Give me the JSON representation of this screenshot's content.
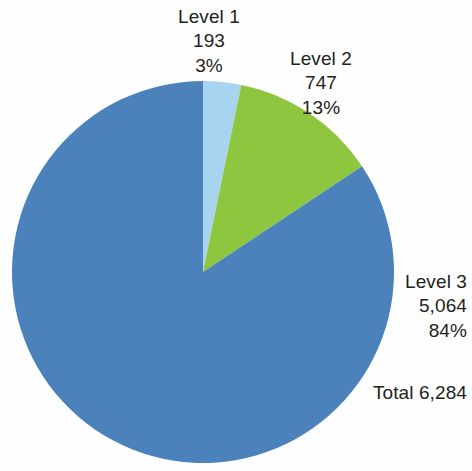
{
  "chart_data": {
    "type": "pie",
    "title": "",
    "subtitle": "",
    "xlabel": "",
    "ylabel": "",
    "legend_position": "none",
    "grid": false,
    "categories": [
      "Level 1",
      "Level 2",
      "Level 3"
    ],
    "values": [
      193,
      747,
      5064
    ],
    "percentages": [
      "3%",
      "13%",
      "84%"
    ],
    "value_labels": [
      "193",
      "747",
      "5,064"
    ],
    "colors": [
      "#a8d4f0",
      "#8ec63f",
      "#4c82bc"
    ],
    "total_label": "Total 6,284",
    "total_value": 6284,
    "start_angle_deg": 0,
    "direction": "clockwise",
    "slices": [
      {
        "name": "Level 1",
        "label": "Level 1",
        "value": "193",
        "percent": "3%",
        "color": "#a8d4f0",
        "fraction": 0.0307
      },
      {
        "name": "Level 2",
        "label": "Level 2",
        "value": "747",
        "percent": "13%",
        "color": "#8ec63f",
        "fraction": 0.1189
      },
      {
        "name": "Level 3",
        "label": "Level 3",
        "value": "5,064",
        "percent": "84%",
        "color": "#4c82bc",
        "fraction": 0.8059
      }
    ]
  },
  "callouts": {
    "level_1": {
      "label": "Level 1",
      "value": "193",
      "percent": "3%"
    },
    "level_2": {
      "label": "Level 2",
      "value": "747",
      "percent": "13%"
    },
    "level_3": {
      "label": "Level 3",
      "value": "5,064",
      "percent": "84%"
    },
    "total": "Total 6,284"
  },
  "palette": {
    "level_1": "#a8d4f0",
    "level_2": "#8ec63f",
    "level_3": "#4c82bc",
    "text": "#231f20",
    "background": "#fefefe"
  }
}
